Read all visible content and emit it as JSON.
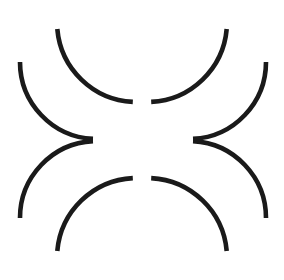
{
  "figure": {
    "title": "Illusory contour figure",
    "kind": "line-drawing",
    "canvas": {
      "width": 284,
      "height": 280,
      "background_color": "#ffffff"
    },
    "stroke": {
      "color": "#1a1a1a",
      "width": 4.6,
      "linecap": "butt"
    },
    "illusory_center": {
      "x": 143,
      "y": 140,
      "perceived_radius": 42
    },
    "arcs": [
      {
        "name": "top-left-arc",
        "cx": 137,
        "cy": 22,
        "r": 80,
        "start_angle": 93,
        "end_angle": 175,
        "opening_direction": "right",
        "start_point": {
          "x": 133,
          "y": 102
        },
        "end_point": {
          "x": 57,
          "y": 29
        }
      },
      {
        "name": "top-right-arc",
        "cx": 147,
        "cy": 22,
        "r": 80,
        "start_angle": 5,
        "end_angle": 87,
        "opening_direction": "left",
        "start_point": {
          "x": 227,
          "y": 29
        },
        "end_point": {
          "x": 151,
          "y": 102
        }
      },
      {
        "name": "middle-left-upper-arc",
        "cx": 97,
        "cy": 62,
        "r": 77,
        "start_angle": 93,
        "end_angle": 180,
        "opening_direction": "up-right",
        "start_point": {
          "x": 93,
          "y": 139
        },
        "end_point": {
          "x": 20,
          "y": 62
        }
      },
      {
        "name": "middle-right-upper-arc",
        "cx": 189,
        "cy": 62,
        "r": 77,
        "start_angle": 0,
        "end_angle": 87,
        "opening_direction": "up-left",
        "start_point": {
          "x": 266,
          "y": 62
        },
        "end_point": {
          "x": 193,
          "y": 139
        }
      },
      {
        "name": "middle-left-lower-arc",
        "cx": 97,
        "cy": 218,
        "r": 77,
        "start_angle": 180,
        "end_angle": 267,
        "opening_direction": "down-right",
        "start_point": {
          "x": 20,
          "y": 218
        },
        "end_point": {
          "x": 93,
          "y": 141
        }
      },
      {
        "name": "middle-right-lower-arc",
        "cx": 189,
        "cy": 218,
        "r": 77,
        "start_angle": 273,
        "end_angle": 360,
        "opening_direction": "down-left",
        "start_point": {
          "x": 193,
          "y": 141
        },
        "end_point": {
          "x": 266,
          "y": 218
        }
      },
      {
        "name": "bottom-left-arc",
        "cx": 137,
        "cy": 258,
        "r": 80,
        "start_angle": 185,
        "end_angle": 267,
        "opening_direction": "right",
        "start_point": {
          "x": 57,
          "y": 251
        },
        "end_point": {
          "x": 133,
          "y": 178
        }
      },
      {
        "name": "bottom-right-arc",
        "cx": 147,
        "cy": 258,
        "r": 80,
        "start_angle": 273,
        "end_angle": 355,
        "opening_direction": "left",
        "start_point": {
          "x": 151,
          "y": 178
        },
        "end_point": {
          "x": 227,
          "y": 251
        }
      }
    ]
  }
}
